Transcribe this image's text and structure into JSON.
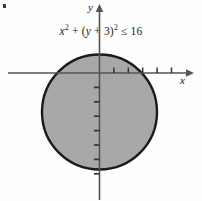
{
  "figure": {
    "width": 202,
    "height": 201,
    "background_color": "#fdfdfd",
    "corner_mark": "bullet-artifact"
  },
  "equation": {
    "full_text": "x² + (y + 3)² ≤ 16",
    "lhs_var_x": "x",
    "lhs_exp_x": "2",
    "plus_1": " + ",
    "open_paren": "(",
    "lhs_var_y": "y",
    "plus_2": " + ",
    "constant": "3",
    "close_paren": ")",
    "lhs_exp_y": "2",
    "relation": " ≤ ",
    "rhs": "16"
  },
  "axes": {
    "x_label": "x",
    "y_label": "y",
    "x_axis_color": "#555555",
    "y_axis_color": "#555555",
    "tick_color": "#333333",
    "x_ticks_right_count": 5,
    "y_ticks_below_count": 7,
    "unit_px": 14.4,
    "origin": {
      "x": 99.5,
      "y": 73
    }
  },
  "chart_data": {
    "type": "scatter",
    "xlabel": "x",
    "ylabel": "y",
    "grid": false,
    "legend": "none",
    "shaded_region": {
      "shape": "disk",
      "center_x": 0,
      "center_y": -3,
      "radius": 4,
      "boundary": "solid",
      "inclusive": true,
      "fill_color": "#a8a8a8",
      "stroke_color": "#1a1a1a"
    },
    "xlim": [
      -6.4,
      6.3
    ],
    "ylim": [
      -8.9,
      4.5
    ]
  }
}
